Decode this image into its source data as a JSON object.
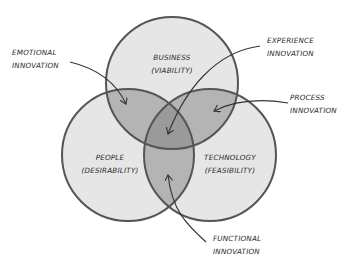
{
  "diagram": {
    "type": "venn",
    "circles": [
      {
        "id": "business",
        "line1": "BUSINESS",
        "line2": "(VIABILITY)",
        "cx": 172,
        "cy": 83,
        "r": 66
      },
      {
        "id": "people",
        "line1": "PEOPLE",
        "line2": "(DESIRABILITY)",
        "cx": 128,
        "cy": 155,
        "r": 66
      },
      {
        "id": "technology",
        "line1": "TECHNOLOGY",
        "line2": "(FEASIBILITY)",
        "cx": 210,
        "cy": 155,
        "r": 66
      }
    ],
    "annotations": [
      {
        "id": "emotional",
        "line1": "EMOTIONAL",
        "line2": "INNOVATION"
      },
      {
        "id": "experience",
        "line1": "EXPERIENCE",
        "line2": "INNOVATION"
      },
      {
        "id": "process",
        "line1": "PROCESS",
        "line2": "INNOVATION"
      },
      {
        "id": "functional",
        "line1": "FUNCTIONAL",
        "line2": "INNOVATION"
      }
    ],
    "colors": {
      "circle_fill": "#e6e6e6",
      "overlap_fill": "#b4b4b4",
      "center_fill": "#9a9a9a",
      "stroke": "#555555",
      "text": "#2a2a2a"
    }
  }
}
